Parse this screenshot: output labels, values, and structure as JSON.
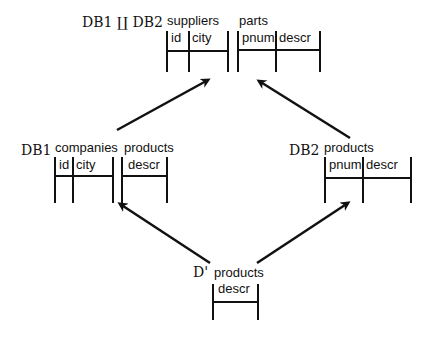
{
  "diagram": {
    "type": "schema-merge-diagram",
    "nodes": [
      {
        "id": "merged",
        "db_label": "DB1 ∐ DB2",
        "tables": [
          {
            "name": "suppliers",
            "columns": [
              "id",
              "city"
            ]
          },
          {
            "name": "parts",
            "columns": [
              "pnum",
              "descr"
            ]
          }
        ]
      },
      {
        "id": "db1",
        "db_label": "DB1",
        "tables": [
          {
            "name": "companies",
            "columns": [
              "id",
              "city"
            ]
          },
          {
            "name": "products",
            "columns": [
              "descr"
            ]
          }
        ]
      },
      {
        "id": "db2",
        "db_label": "DB2",
        "tables": [
          {
            "name": "products",
            "columns": [
              "pnum",
              "descr"
            ]
          }
        ]
      },
      {
        "id": "dprime",
        "db_label": "D'",
        "tables": [
          {
            "name": "products",
            "columns": [
              "descr"
            ]
          }
        ]
      }
    ],
    "edges": [
      {
        "from": "db1",
        "to": "merged"
      },
      {
        "from": "db2",
        "to": "merged"
      },
      {
        "from": "dprime",
        "to": "db1"
      },
      {
        "from": "dprime",
        "to": "db2"
      }
    ]
  }
}
